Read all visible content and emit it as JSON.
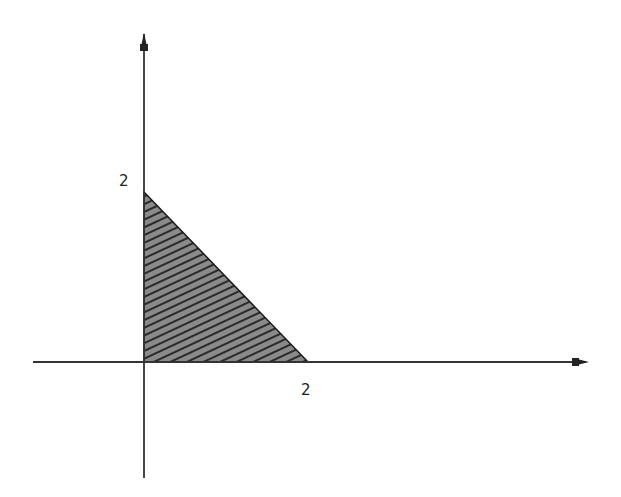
{
  "diagram": {
    "type": "shaded-region",
    "axes": {
      "x_axis": {
        "label": "",
        "tick_labels": [
          "2"
        ]
      },
      "y_axis": {
        "label": "",
        "tick_labels": [
          "2"
        ]
      }
    },
    "region": {
      "vertices": [
        [
          0,
          0
        ],
        [
          2,
          0
        ],
        [
          0,
          2
        ]
      ],
      "fill": "hatched",
      "fill_color": "#8a8a8a",
      "hatch_color": "#2a2a2a",
      "edge_color": "#1a1a1a"
    },
    "labels": {
      "y_tick": "2",
      "x_tick": "2"
    },
    "colors": {
      "axis": "#333333",
      "background": "#ffffff"
    }
  }
}
